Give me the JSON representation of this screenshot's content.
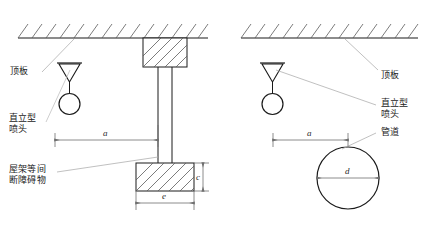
{
  "diagram": {
    "type": "engineering-drawing",
    "background_color": "#ffffff",
    "line_color": "#1a1a1a",
    "leader_color": "#8c8c8c",
    "hatch_color": "#5a5a5a",
    "dimension_color": "#6e6e6e",
    "panels": [
      {
        "id": "left",
        "name": "truss-obstacle-panel",
        "labels": {
          "ceiling": "顶板",
          "sprinkler_line1": "直立型",
          "sprinkler_line2": "喷头",
          "obstacle_line1": "屋架等间",
          "obstacle_line2": "断障碍物"
        },
        "dimensions": [
          {
            "name": "horizontal-distance",
            "symbol": "a"
          },
          {
            "name": "obstacle-height",
            "symbol": "c"
          },
          {
            "name": "obstacle-width",
            "symbol": "e"
          }
        ],
        "elements": [
          {
            "name": "ceiling-slab",
            "kind": "hatched-line"
          },
          {
            "name": "upright-sprinkler",
            "kind": "symbol"
          },
          {
            "name": "beam-column",
            "kind": "vertical-double-line"
          },
          {
            "name": "upper-hatched-block",
            "kind": "hatched-rect"
          },
          {
            "name": "lower-hatched-block",
            "kind": "hatched-rect"
          }
        ]
      },
      {
        "id": "right",
        "name": "pipe-obstacle-panel",
        "labels": {
          "ceiling": "顶板",
          "sprinkler_line1": "直立型",
          "sprinkler_line2": "喷头",
          "pipe": "管道"
        },
        "dimensions": [
          {
            "name": "horizontal-distance",
            "symbol": "a"
          },
          {
            "name": "pipe-diameter",
            "symbol": "d"
          }
        ],
        "elements": [
          {
            "name": "ceiling-slab",
            "kind": "hatched-line"
          },
          {
            "name": "upright-sprinkler",
            "kind": "symbol"
          },
          {
            "name": "pipe-circle",
            "kind": "circle"
          }
        ]
      }
    ]
  }
}
